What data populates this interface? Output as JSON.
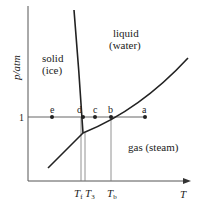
{
  "diagram": {
    "type": "phase-diagram",
    "subject": "water",
    "axes": {
      "y_label": "p/atm",
      "x_label": "T",
      "y_tick": "1"
    },
    "regions": [
      {
        "id": "solid",
        "line1": "solid",
        "line2": "(ice)"
      },
      {
        "id": "liquid",
        "line1": "liquid",
        "line2": "(water)"
      },
      {
        "id": "gas",
        "line1": "gas  (steam)"
      }
    ],
    "points": [
      {
        "id": "e",
        "label": "e"
      },
      {
        "id": "d",
        "label": "d"
      },
      {
        "id": "c",
        "label": "c"
      },
      {
        "id": "b",
        "label": "b"
      },
      {
        "id": "a",
        "label": "a"
      }
    ],
    "temperature_markers": [
      {
        "id": "Tf",
        "symbol": "T",
        "subscript": "f"
      },
      {
        "id": "T3",
        "symbol": "T",
        "subscript": "3"
      },
      {
        "id": "Tb",
        "symbol": "T",
        "subscript": "b"
      }
    ],
    "curves": [
      {
        "id": "melting-curve",
        "name": "solid-liquid boundary"
      },
      {
        "id": "vaporization-curve",
        "name": "liquid-gas boundary"
      },
      {
        "id": "sublimation-curve",
        "name": "solid-gas boundary"
      }
    ],
    "colors": {
      "line": "#222222",
      "axis": "#555555"
    }
  }
}
